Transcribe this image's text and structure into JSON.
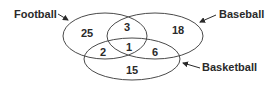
{
  "diagram": {
    "type": "venn",
    "sets": [
      {
        "name": "Football",
        "label": "Football"
      },
      {
        "name": "Baseball",
        "label": "Baseball"
      },
      {
        "name": "Basketball",
        "label": "Basketball"
      }
    ],
    "regions": {
      "football_only": "25",
      "baseball_only": "18",
      "basketball_only": "15",
      "football_baseball": "3",
      "football_basketball": "2",
      "baseball_basketball": "6",
      "all_three": "1"
    }
  }
}
